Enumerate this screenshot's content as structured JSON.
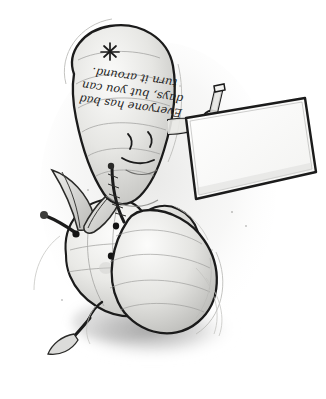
{
  "image": {
    "title": "Upside-down pencil illustration of a pear character holding a sign beside a smiling apple",
    "medium": "graphite pencil sketch with grey wash shading",
    "background_color": "#ffffff",
    "orientation_note": "whole scene is rotated 180 degrees (upside down)",
    "canvas": {
      "width": 326,
      "height": 399
    }
  },
  "sign": {
    "name": "handheld placard",
    "lines": [
      "Everyone has bad",
      "days, but you can",
      "turn it around."
    ],
    "full_text": "Everyone has bad days, but you can turn it around.",
    "paper_color": "#fdfdfd",
    "border_color": "#1a1a1a",
    "ink_color": "#1c1c1c"
  },
  "characters": [
    {
      "id": "pear",
      "label": "Pear character",
      "description": "large pear drawn upside down, with a small smiling face, one arm raised holding a wooden stick attached to the sign",
      "face": {
        "eyes": 2,
        "mouth": "small smile",
        "expression": "content"
      },
      "details": [
        "blossom-end star mark",
        "stem",
        "raised arm",
        "wooden stick handle"
      ],
      "body_color": "#e8e8e6",
      "outline_color": "#1b1b1b"
    },
    {
      "id": "apple",
      "label": "Apple character",
      "description": "round apple drawn upside down with a broad smile, dot eyes, blush cheek, stem with two leaves",
      "face": {
        "eyes": 2,
        "mouth": "wide smile",
        "expression": "happy"
      },
      "details": [
        "stem",
        "two pointed leaves",
        "blush cheek"
      ],
      "body_color": "#ececea",
      "outline_color": "#1b1b1b"
    }
  ],
  "scene": {
    "shadow": {
      "label": "ground shadow",
      "color": "#9a9a9a"
    },
    "stick": {
      "label": "wooden sign post",
      "color": "#d9d9d6"
    },
    "leaves": {
      "count": 3,
      "color": "#c9c9c6"
    }
  },
  "palette": {
    "paper_white": "#ffffff",
    "light_grey": "#ededeb",
    "mid_grey": "#b4b4b2",
    "shadow_grey": "#8d8d8d",
    "ink_black": "#1b1b1b"
  }
}
